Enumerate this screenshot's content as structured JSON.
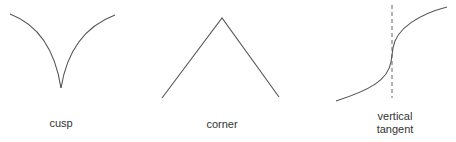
{
  "figures": [
    {
      "id": "cusp",
      "label": "cusp"
    },
    {
      "id": "corner",
      "label": "corner"
    },
    {
      "id": "vertical-tangent",
      "label_line1": "vertical",
      "label_line2": "tangent"
    }
  ],
  "colors": {
    "stroke": "#555555",
    "text": "#333333",
    "background": "#ffffff"
  }
}
